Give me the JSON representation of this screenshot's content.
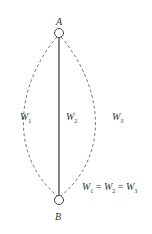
{
  "diagram": {
    "nodes": [
      {
        "id": "A",
        "label": "A"
      },
      {
        "id": "B",
        "label": "B"
      }
    ],
    "paths": [
      {
        "id": "W1",
        "label": "W",
        "subscript": "1",
        "style": "dashed",
        "side": "left"
      },
      {
        "id": "W2",
        "label": "W",
        "subscript": "2",
        "style": "solid",
        "side": "center"
      },
      {
        "id": "W3",
        "label": "W",
        "subscript": "3",
        "style": "dashed",
        "side": "right"
      }
    ],
    "equation": {
      "w1": "W",
      "s1": "1",
      "eq1": " = ",
      "w2": "W",
      "s2": "2",
      "eq2": " = ",
      "w3": "W",
      "s3": "3"
    },
    "colors": {
      "stroke": "#444444",
      "dashed": "#777777",
      "text": "#333333"
    }
  }
}
